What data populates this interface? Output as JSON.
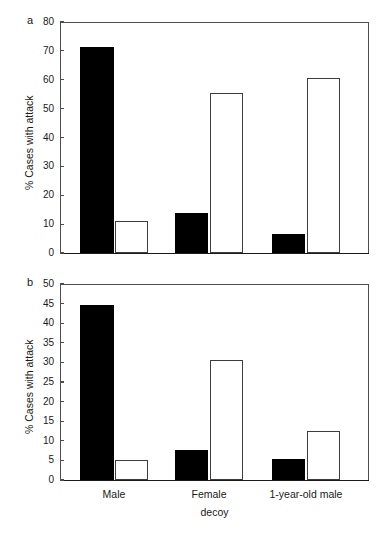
{
  "figure": {
    "background_color": "#ffffff",
    "axis_color": "#4d4d4d",
    "filled_bar_color": "#000000",
    "open_bar_color": "#ffffff"
  },
  "panels": [
    {
      "letter": "a",
      "ylabel": "% Cases with attack",
      "yticks": [
        "0",
        "10",
        "20",
        "30",
        "40",
        "50",
        "60",
        "70",
        "80"
      ]
    },
    {
      "letter": "b",
      "ylabel": "% Cases with attack",
      "yticks": [
        "0",
        "5",
        "10",
        "15",
        "20",
        "25",
        "30",
        "35",
        "40",
        "45",
        "50"
      ],
      "xticks": [
        "Male",
        "Female",
        "1-year-old male"
      ],
      "xaxis_title": "decoy"
    }
  ],
  "chart_data": [
    {
      "type": "bar",
      "panel": "a",
      "title": "",
      "xlabel": "decoy",
      "ylabel": "% Cases with attack",
      "ylim": [
        0,
        80
      ],
      "ytick_values": [
        0,
        10,
        20,
        30,
        40,
        50,
        60,
        70,
        80
      ],
      "grid": false,
      "legend": "none",
      "categories": [
        "Male",
        "Female",
        "1-year-old male"
      ],
      "series": [
        {
          "name": "filled",
          "values": [
            71.3,
            14.0,
            6.7
          ]
        },
        {
          "name": "open",
          "values": [
            11.0,
            55.3,
            60.6
          ]
        }
      ]
    },
    {
      "type": "bar",
      "panel": "b",
      "title": "",
      "xlabel": "decoy",
      "ylabel": "% Cases with attack",
      "ylim": [
        0,
        50
      ],
      "ytick_values": [
        0,
        5,
        10,
        15,
        20,
        25,
        30,
        35,
        40,
        45,
        50
      ],
      "grid": false,
      "legend": "none",
      "categories": [
        "Male",
        "Female",
        "1-year-old male"
      ],
      "series": [
        {
          "name": "filled",
          "values": [
            44.7,
            7.7,
            5.3
          ]
        },
        {
          "name": "open",
          "values": [
            5.0,
            30.6,
            12.5
          ]
        }
      ]
    }
  ]
}
